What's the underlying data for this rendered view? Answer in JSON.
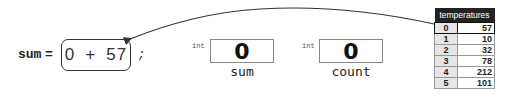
{
  "statement": {
    "lhs": "sum",
    "equals": "=",
    "expression": {
      "left": "0",
      "op": "+",
      "right": "57"
    },
    "terminator": ";"
  },
  "variables": [
    {
      "type": "int",
      "value": "0",
      "name": "sum"
    },
    {
      "type": "int",
      "value": "0",
      "name": "count"
    }
  ],
  "array": {
    "title": "temperatures",
    "highlighted_index": 0,
    "rows": [
      {
        "index": "0",
        "value": "57"
      },
      {
        "index": "1",
        "value": "10"
      },
      {
        "index": "2",
        "value": "32"
      },
      {
        "index": "3",
        "value": "78"
      },
      {
        "index": "4",
        "value": "212"
      },
      {
        "index": "5",
        "value": "101"
      }
    ]
  },
  "arrow": {
    "from": "temperatures[0]",
    "to": "expression-right-operand"
  }
}
